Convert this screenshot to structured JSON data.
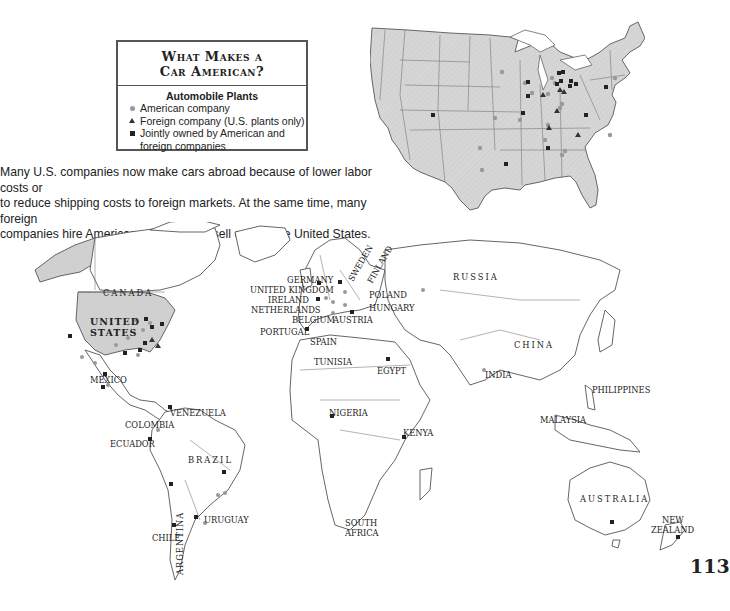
{
  "legend": {
    "title_line1": "What Makes a",
    "title_line2": "Car American?",
    "subtitle": "Automobile Plants",
    "items": [
      {
        "symbol": "circle",
        "color": "#999999",
        "label": "American company"
      },
      {
        "symbol": "triangle",
        "color": "#333333",
        "label": "Foreign company (U.S. plants only)"
      },
      {
        "symbol": "square",
        "color": "#222222",
        "label_line1": "Jointly owned by American and",
        "label_line2": "foreign companies"
      }
    ]
  },
  "caption": {
    "line1": "Many U.S. companies now make cars abroad because of lower labor costs or",
    "line2": "to reduce shipping costs to foreign markets. At the same time, many foreign",
    "line3": "companies hire Americans to build and sell cars in the United States."
  },
  "page_number": "113",
  "colors": {
    "us_fill": "#d4d4d4",
    "land_stroke": "#555555",
    "american": "#999999",
    "foreign": "#333333",
    "joint": "#222222"
  },
  "map_labels": {
    "canada": "CANADA",
    "united_states_1": "UNITED",
    "united_states_2": "STATES",
    "mexico": "MEXICO",
    "venezuela": "VENEZUELA",
    "colombia": "COLOMBIA",
    "ecuador": "ECUADOR",
    "brazil": "BRAZIL",
    "chile": "CHILE",
    "argentina": "ARGENTINA",
    "uruguay": "URUGUAY",
    "germany": "GERMANY",
    "united_kingdom": "UNITED KINGDOM",
    "ireland": "IRELAND",
    "netherlands": "NETHERLANDS",
    "belgium": "BELGIUM",
    "austria": "AUSTRIA",
    "portugal": "PORTUGAL",
    "spain": "SPAIN",
    "sweden": "SWEDEN",
    "finland": "FINLAND",
    "poland": "POLAND",
    "hungary": "HUNGARY",
    "russia": "RUSSIA",
    "tunisia": "TUNISIA",
    "egypt": "EGYPT",
    "nigeria": "NIGERIA",
    "kenya": "KENYA",
    "south_africa_1": "SOUTH",
    "south_africa_2": "AFRICA",
    "china": "CHINA",
    "india": "INDIA",
    "philippines": "PHILIPPINES",
    "malaysia": "MALAYSIA",
    "australia": "AUSTRALIA",
    "new_zealand_1": "NEW",
    "new_zealand_2": "ZEALAND"
  },
  "plants_us_inset": {
    "american": [
      [
        395,
        192
      ],
      [
        467,
        228
      ],
      [
        487,
        260
      ],
      [
        535,
        265
      ],
      [
        545,
        215
      ],
      [
        550,
        230
      ],
      [
        565,
        300
      ],
      [
        570,
        290
      ],
      [
        370,
        330
      ],
      [
        450,
        340
      ],
      [
        535,
        355
      ],
      [
        525,
        398
      ],
      [
        330,
        420
      ],
      [
        335,
        487
      ],
      [
        575,
        440
      ],
      [
        585,
        428
      ],
      [
        720,
        380
      ],
      [
        735,
        213
      ]
    ],
    "foreign": [
      [
        520,
        283
      ],
      [
        570,
        272
      ],
      [
        583,
        278
      ],
      [
        563,
        335
      ],
      [
        537,
        385
      ],
      [
        627,
        404
      ]
    ],
    "joint": [
      [
        475,
        245
      ],
      [
        475,
        287
      ],
      [
        461,
        340
      ],
      [
        565,
        220
      ],
      [
        578,
        217
      ],
      [
        560,
        250
      ],
      [
        573,
        242
      ],
      [
        604,
        242
      ],
      [
        602,
        258
      ],
      [
        617,
        252
      ],
      [
        707,
        262
      ],
      [
        645,
        345
      ],
      [
        534,
        444
      ],
      [
        407,
        492
      ],
      [
        185,
        322
      ]
    ]
  }
}
